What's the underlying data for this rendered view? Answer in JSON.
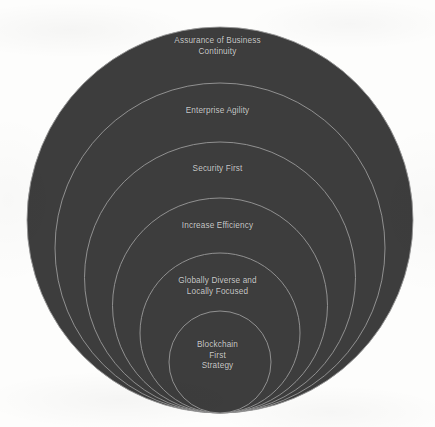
{
  "diagram": {
    "type": "nested-tangent-circles",
    "canvas": {
      "width": 435,
      "height": 427
    },
    "colors": {
      "background": "#fdfdfc",
      "circle_fill": "#3d3d3d",
      "circle_stroke": "#9a9a9a",
      "label_text": "#c9c9c9"
    },
    "geometry": {
      "center_x": 220,
      "tangent_bottom_y": 413,
      "note": "All circles are internally tangent at the bottom point."
    },
    "rings": [
      {
        "index": 1,
        "name": "assurance-of-business-continuity",
        "lines": [
          "Assurance of Business",
          "Continuity"
        ],
        "diameter": 386,
        "top_y": 27,
        "label_y": 36
      },
      {
        "index": 2,
        "name": "enterprise-agility",
        "lines": [
          "Enterprise Agility"
        ],
        "diameter": 330,
        "top_y": 83,
        "label_y": 106
      },
      {
        "index": 3,
        "name": "security-first",
        "lines": [
          "Security First"
        ],
        "diameter": 271,
        "top_y": 142,
        "label_y": 164
      },
      {
        "index": 4,
        "name": "increase-efficiency",
        "lines": [
          "Increase Efficiency"
        ],
        "diameter": 215,
        "top_y": 198,
        "label_y": 221
      },
      {
        "index": 5,
        "name": "globally-diverse-and-locally-focused",
        "lines": [
          "Globally Diverse and",
          "Locally Focused"
        ],
        "diameter": 160,
        "top_y": 253,
        "label_y": 276
      },
      {
        "index": 6,
        "name": "blockchain-first-strategy",
        "lines": [
          "Blockchain",
          "First",
          "Strategy"
        ],
        "diameter": 102,
        "top_y": 311,
        "label_y": 340
      }
    ]
  }
}
